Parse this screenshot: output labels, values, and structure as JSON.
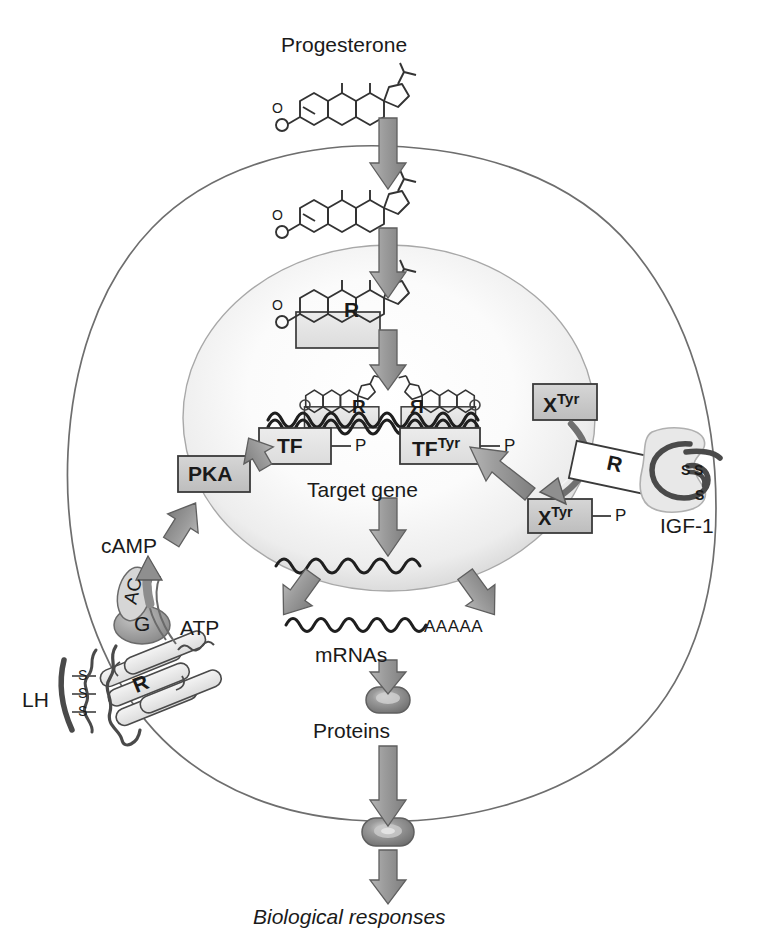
{
  "diagram": {
    "ligand_top": "Progesterone",
    "colors": {
      "outline": "#6e6e6e",
      "membrane_line": "#7a7a7a",
      "arrow_fill": "#9a9a9a",
      "arrow_stroke": "#5a5a5a",
      "box_fill": "#c9c9c9",
      "box_fill_light": "#e3e3e3",
      "box_stroke": "#3a3a3a",
      "text": "#1a1a1a",
      "nucleus_rim": "#9e9e9e",
      "dna_stroke": "#2b2b2b",
      "protein_fill": "#8c8c8c",
      "receptor_fill": "#ededed",
      "g_protein_fill": "#a8a8a8"
    }
  },
  "labels": {
    "progesterone": "Progesterone",
    "receptor_r": "R",
    "receptor_r_dimer_left": "R",
    "receptor_r_dimer_right": "R",
    "tf": "TF",
    "tf_tyr_base": "TF",
    "tf_tyr_sup": "Tyr",
    "phospho_tf": "P",
    "phospho_tf_tyr": "P",
    "target_gene": "Target gene",
    "pka": "PKA",
    "camp": "cAMP",
    "atp": "ATP",
    "adenylate_cyclase": "AC",
    "g_protein": "G",
    "lh_receptor": "R",
    "lh": "LH",
    "disulfide_1": "S",
    "disulfide_2": "S",
    "disulfide_3": "S",
    "x_tyr_base": "X",
    "x_tyr_sup": "Tyr",
    "x_tyr_p_base": "X",
    "x_tyr_p_sup": "Tyr",
    "phospho_x_tyr": "P",
    "igf1_receptor": "R",
    "igf1": "IGF-1",
    "igf_ss_1": "S",
    "igf_ss_2": "S",
    "igf_ss_3": "S",
    "mrna_polya": "AAAAA",
    "mrnas": "mRNAs",
    "proteins": "Proteins",
    "biological_responses": "Biological responses",
    "steroid_oxygen_1": "O",
    "steroid_oxygen_2": "O",
    "steroid_oxygen_3": "O",
    "steroid_oxygen_dimer_left": "O",
    "steroid_oxygen_dimer_right": "O"
  },
  "structures": {
    "cell_membrane": "irregular-oval-cell-outline",
    "nucleus": "shaded-oval-nucleus",
    "steroid_molecule": "four-ring-steroid-skeleton",
    "dna_wave": "double-wavy-dna-strand",
    "mrna_wave": "single-wavy-mrna-strand",
    "protein_blob": "rounded-oblong-protein"
  },
  "arrows": {
    "progesterone_to_membrane": "down",
    "membrane_to_nucleus": "down",
    "steroid_r_to_gene": "down",
    "pka_to_tf": "up-right",
    "camp_to_pka": "up-right",
    "atp_to_camp": "curved-up",
    "x_tyr_to_tf_tyr": "up-left-long",
    "x_tyr_to_x_tyr_p": "curved-down",
    "gene_to_mrna_left": "down-left",
    "gene_to_mrna_right": "down-right",
    "transcription": "down",
    "mrna_to_protein": "down",
    "protein_out_of_cell": "down",
    "protein_to_responses": "down"
  }
}
